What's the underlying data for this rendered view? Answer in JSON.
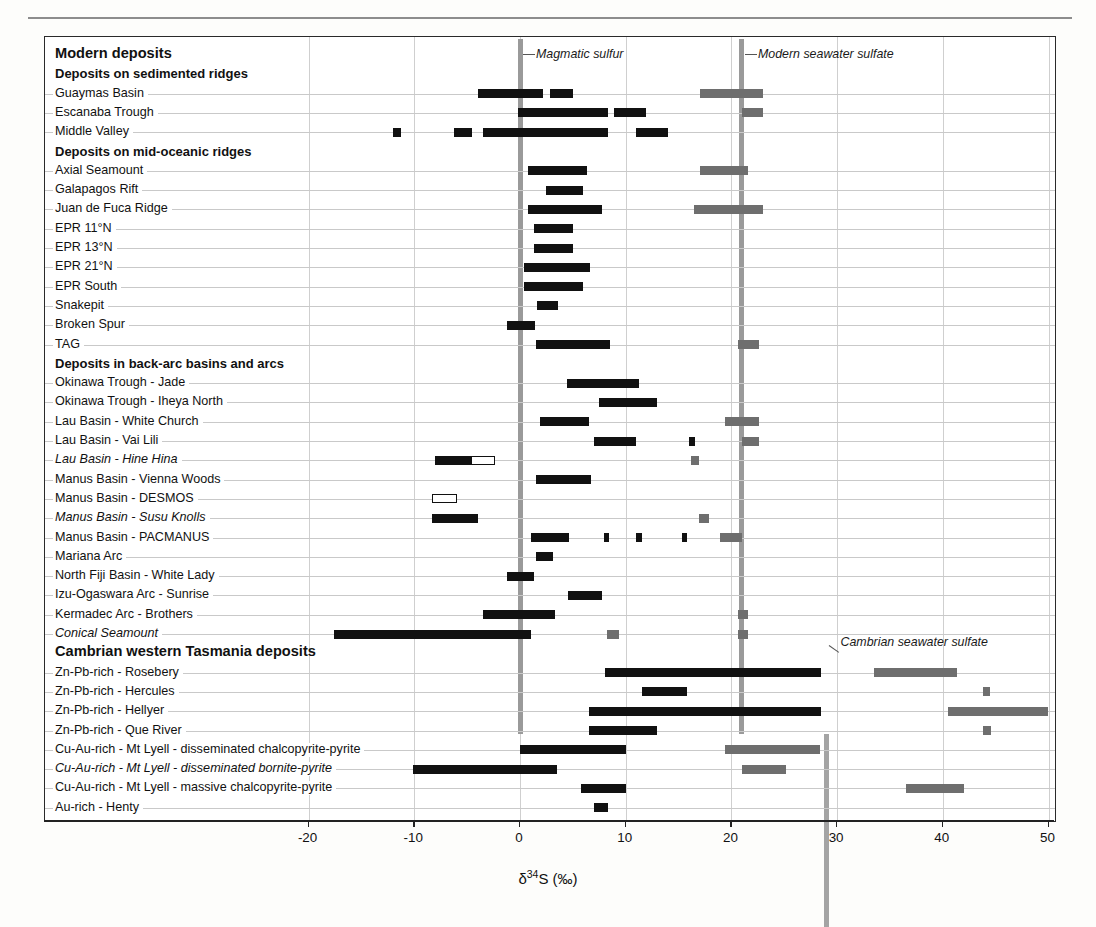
{
  "page": {
    "ghost_text": ""
  },
  "axis": {
    "xlabel_delta": "δ",
    "xlabel_sup": "34",
    "xlabel_rest": "S (‰)",
    "ticks": [
      -20,
      -10,
      0,
      10,
      20,
      30,
      40,
      50
    ],
    "xmin": -22.5,
    "xmax": 51.5
  },
  "annotations": [
    {
      "text": "Magmatic sulfur",
      "value": 0
    },
    {
      "text": "Modern seawater sulfate",
      "value": 21
    },
    {
      "text": "Cambrian seawater sulfate",
      "value": 29
    }
  ],
  "reference_lines": [
    {
      "name": "magmatic-sulfur-line",
      "value": 0,
      "color": "#9a9a9a",
      "from_row": 0,
      "to_row": 35
    },
    {
      "name": "modern-seawater-sulfate-line",
      "value": 21,
      "color": "#9a9a9a",
      "from_row": 0,
      "to_row": 35
    },
    {
      "name": "cambrian-seawater-sulfate-line",
      "value": 29,
      "color": "#a4a4a4",
      "from_row": 36,
      "to_row": 45
    }
  ],
  "chart_data": {
    "type": "bar",
    "orientation": "horizontal-ranges",
    "title": "",
    "xlabel": "δ34S (‰)",
    "ylabel": "",
    "xlim": [
      -22.5,
      51.5
    ],
    "xticks": [
      -20,
      -10,
      0,
      10,
      20,
      30,
      40,
      50
    ],
    "grid": "vertical-light",
    "legend": "none",
    "series_colors": {
      "sulfide": "#111111",
      "sulfate": "#6e6e6e",
      "open": "#ffffff"
    },
    "rows": [
      {
        "label": "Modern deposits",
        "kind": "heading1",
        "bars": []
      },
      {
        "label": "Deposits on sedimented ridges",
        "kind": "heading2",
        "bars": []
      },
      {
        "label": "Guaymas Basin",
        "kind": "item",
        "bars": [
          {
            "from": -4.0,
            "to": 2.2,
            "style": "sulfide"
          },
          {
            "from": 2.8,
            "to": 5.0,
            "style": "sulfide"
          },
          {
            "from": 17.0,
            "to": 23.0,
            "style": "sulfate"
          }
        ]
      },
      {
        "label": "Escanaba Trough",
        "kind": "item",
        "bars": [
          {
            "from": -0.2,
            "to": 8.3,
            "style": "sulfide"
          },
          {
            "from": 8.9,
            "to": 11.9,
            "style": "sulfide"
          },
          {
            "from": 21.0,
            "to": 23.0,
            "style": "sulfate"
          }
        ]
      },
      {
        "label": "Middle Valley",
        "kind": "item",
        "bars": [
          {
            "from": -12.0,
            "to": -11.3,
            "style": "sulfide"
          },
          {
            "from": -6.2,
            "to": -4.5,
            "style": "sulfide"
          },
          {
            "from": -3.5,
            "to": 8.3,
            "style": "sulfide"
          },
          {
            "from": 11.0,
            "to": 14.0,
            "style": "sulfide"
          }
        ]
      },
      {
        "label": "Deposits on mid-oceanic ridges",
        "kind": "heading2",
        "bars": []
      },
      {
        "label": "Axial Seamount",
        "kind": "item",
        "bars": [
          {
            "from": 0.8,
            "to": 6.3,
            "style": "sulfide"
          },
          {
            "from": 17.0,
            "to": 21.6,
            "style": "sulfate"
          }
        ]
      },
      {
        "label": "Galapagos Rift",
        "kind": "item",
        "bars": [
          {
            "from": 2.5,
            "to": 6.0,
            "style": "sulfide"
          }
        ]
      },
      {
        "label": "Juan de Fuca Ridge",
        "kind": "item",
        "bars": [
          {
            "from": 0.8,
            "to": 7.8,
            "style": "sulfide"
          },
          {
            "from": 16.5,
            "to": 23.0,
            "style": "sulfate"
          }
        ]
      },
      {
        "label": "EPR 11°N",
        "kind": "item",
        "bars": [
          {
            "from": 1.3,
            "to": 5.0,
            "style": "sulfide"
          }
        ]
      },
      {
        "label": "EPR 13°N",
        "kind": "item",
        "bars": [
          {
            "from": 1.3,
            "to": 5.0,
            "style": "sulfide"
          }
        ]
      },
      {
        "label": "EPR 21°N",
        "kind": "item",
        "bars": [
          {
            "from": 0.4,
            "to": 6.6,
            "style": "sulfide"
          }
        ]
      },
      {
        "label": "EPR South",
        "kind": "item",
        "bars": [
          {
            "from": 0.4,
            "to": 6.0,
            "style": "sulfide"
          }
        ]
      },
      {
        "label": "Snakepit",
        "kind": "item",
        "bars": [
          {
            "from": 1.6,
            "to": 3.6,
            "style": "sulfide"
          }
        ]
      },
      {
        "label": "Broken Spur",
        "kind": "item",
        "bars": [
          {
            "from": -1.2,
            "to": 1.4,
            "style": "sulfide"
          }
        ]
      },
      {
        "label": "TAG",
        "kind": "item",
        "bars": [
          {
            "from": 1.5,
            "to": 8.5,
            "style": "sulfide"
          },
          {
            "from": 20.6,
            "to": 22.6,
            "style": "sulfate"
          }
        ]
      },
      {
        "label": "Deposits in back-arc basins and arcs",
        "kind": "heading2",
        "bars": []
      },
      {
        "label": "Okinawa Trough - Jade",
        "kind": "item",
        "bars": [
          {
            "from": 4.4,
            "to": 11.3,
            "style": "sulfide"
          }
        ]
      },
      {
        "label": "Okinawa Trough - Iheya North",
        "kind": "item",
        "bars": [
          {
            "from": 7.5,
            "to": 13.0,
            "style": "sulfide"
          }
        ]
      },
      {
        "label": "Lau Basin - White Church",
        "kind": "item",
        "bars": [
          {
            "from": 1.9,
            "to": 6.5,
            "style": "sulfide"
          },
          {
            "from": 19.4,
            "to": 22.6,
            "style": "sulfate"
          }
        ]
      },
      {
        "label": "Lau Basin - Vai Lili",
        "kind": "item",
        "bars": [
          {
            "from": 7.0,
            "to": 11.0,
            "style": "sulfide"
          },
          {
            "from": 16.0,
            "to": 16.6,
            "style": "sulfide"
          },
          {
            "from": 21.0,
            "to": 22.6,
            "style": "sulfate"
          }
        ]
      },
      {
        "label": "Lau Basin - Hine Hina",
        "kind": "item-italic",
        "bars": [
          {
            "from": -8.0,
            "to": -4.6,
            "style": "sulfide"
          },
          {
            "from": -4.6,
            "to": -2.4,
            "style": "open"
          },
          {
            "from": 16.2,
            "to": 16.9,
            "style": "sulfate"
          }
        ]
      },
      {
        "label": "Manus Basin - Vienna Woods",
        "kind": "item",
        "bars": [
          {
            "from": 1.5,
            "to": 6.7,
            "style": "sulfide"
          }
        ]
      },
      {
        "label": "Manus Basin - DESMOS",
        "kind": "item",
        "bars": [
          {
            "from": -8.3,
            "to": -6.0,
            "style": "open"
          }
        ]
      },
      {
        "label": "Manus Basin - Susu Knolls",
        "kind": "item-italic",
        "bars": [
          {
            "from": -8.3,
            "to": -4.0,
            "style": "sulfide"
          },
          {
            "from": 16.9,
            "to": 17.9,
            "style": "sulfate"
          }
        ]
      },
      {
        "label": "Manus Basin - PACMANUS",
        "kind": "item",
        "bars": [
          {
            "from": 1.0,
            "to": 4.6,
            "style": "sulfide"
          },
          {
            "from": 7.9,
            "to": 8.4,
            "style": "sulfide"
          },
          {
            "from": 11.0,
            "to": 11.5,
            "style": "sulfide"
          },
          {
            "from": 15.3,
            "to": 15.8,
            "style": "sulfide"
          },
          {
            "from": 18.9,
            "to": 21.0,
            "style": "sulfate"
          }
        ]
      },
      {
        "label": "Mariana Arc",
        "kind": "item",
        "bars": [
          {
            "from": 1.5,
            "to": 3.1,
            "style": "sulfide"
          }
        ]
      },
      {
        "label": "North Fiji Basin - White Lady",
        "kind": "item",
        "bars": [
          {
            "from": -1.2,
            "to": 1.3,
            "style": "sulfide"
          }
        ]
      },
      {
        "label": "Izu-Ogaswara Arc - Sunrise",
        "kind": "item",
        "bars": [
          {
            "from": 4.5,
            "to": 7.8,
            "style": "sulfide"
          }
        ]
      },
      {
        "label": "Kermadec Arc - Brothers",
        "kind": "item",
        "bars": [
          {
            "from": -3.5,
            "to": 3.3,
            "style": "sulfide"
          },
          {
            "from": 20.6,
            "to": 21.6,
            "style": "sulfate"
          }
        ]
      },
      {
        "label": "Conical Seamount",
        "kind": "item-italic",
        "bars": [
          {
            "from": -17.6,
            "to": 1.0,
            "style": "sulfide"
          },
          {
            "from": 8.2,
            "to": 9.4,
            "style": "sulfate"
          },
          {
            "from": 20.6,
            "to": 21.6,
            "style": "sulfate"
          }
        ]
      },
      {
        "label": "Cambrian western Tasmania deposits",
        "kind": "heading1",
        "bars": []
      },
      {
        "label": "Zn-Pb-rich - Rosebery",
        "kind": "item",
        "bars": [
          {
            "from": 8.0,
            "to": 28.5,
            "style": "sulfide"
          },
          {
            "from": 33.5,
            "to": 41.3,
            "style": "sulfate"
          }
        ]
      },
      {
        "label": "Zn-Pb-rich - Hercules",
        "kind": "item",
        "bars": [
          {
            "from": 11.5,
            "to": 15.8,
            "style": "sulfide"
          },
          {
            "from": 43.8,
            "to": 44.5,
            "style": "sulfate"
          }
        ]
      },
      {
        "label": "Zn-Pb-rich - Hellyer",
        "kind": "item",
        "bars": [
          {
            "from": 6.5,
            "to": 28.5,
            "style": "sulfide"
          },
          {
            "from": 40.5,
            "to": 50.0,
            "style": "sulfate"
          }
        ]
      },
      {
        "label": "Zn-Pb-rich - Que River",
        "kind": "item",
        "bars": [
          {
            "from": 6.5,
            "to": 13.0,
            "style": "sulfide"
          },
          {
            "from": 43.8,
            "to": 44.6,
            "style": "sulfate"
          }
        ]
      },
      {
        "label": "Cu-Au-rich - Mt Lyell - disseminated chalcopyrite-pyrite",
        "kind": "item",
        "bars": [
          {
            "from": 0.0,
            "to": 10.0,
            "style": "sulfide"
          },
          {
            "from": 19.4,
            "to": 28.4,
            "style": "sulfate"
          }
        ]
      },
      {
        "label": "Cu-Au-rich - Mt Lyell - disseminated bornite-pyrite",
        "kind": "item-italic",
        "bars": [
          {
            "from": -10.1,
            "to": 3.5,
            "style": "sulfide"
          },
          {
            "from": 21.0,
            "to": 25.2,
            "style": "sulfate"
          }
        ]
      },
      {
        "label": "Cu-Au-rich - Mt Lyell - massive chalcopyrite-pyrite",
        "kind": "item",
        "bars": [
          {
            "from": 5.8,
            "to": 10.0,
            "style": "sulfide"
          },
          {
            "from": 36.5,
            "to": 42.0,
            "style": "sulfate"
          }
        ]
      },
      {
        "label": "Au-rich - Henty",
        "kind": "item",
        "bars": [
          {
            "from": 7.0,
            "to": 8.3,
            "style": "sulfide"
          }
        ]
      }
    ]
  }
}
